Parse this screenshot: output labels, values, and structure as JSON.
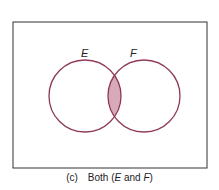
{
  "diagram": {
    "type": "venn",
    "sets": [
      {
        "label": "E",
        "cx": 85,
        "cy": 96,
        "r": 36
      },
      {
        "label": "F",
        "cx": 144,
        "cy": 96,
        "r": 36
      }
    ],
    "shaded_region": "intersection",
    "colors": {
      "circle_stroke": "#8e3a55",
      "shade_fill": "#d8a9b8",
      "frame_stroke": "#333333"
    }
  },
  "labels": {
    "E": "E",
    "F": "F"
  },
  "caption": {
    "prefix": "(c)",
    "text_before": "Both (",
    "E": "E",
    "mid": " and ",
    "F": "F",
    "text_after": ")"
  }
}
